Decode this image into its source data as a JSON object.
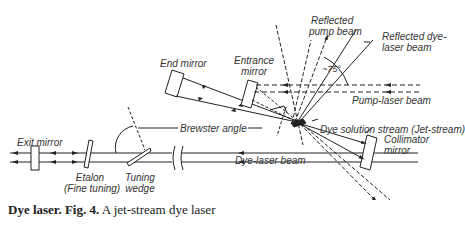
{
  "diagram": {
    "title": "A jet-stream dye laser",
    "labels": {
      "end_mirror": "End mirror",
      "entrance_mirror_1": "Entrance",
      "entrance_mirror_2": "mirror",
      "reflected_pump_1": "Reflected",
      "reflected_pump_2": "pump beam",
      "reflected_dye_1": "Reflected dye-",
      "reflected_dye_2": "laser beam",
      "angle": "~75°",
      "pump_laser_beam": "Pump-laser beam",
      "brewster_angle": "Brewster angle",
      "dye_solution": "Dye solution stream (Jet-stream)",
      "exit_mirror": "Exit mirror",
      "etalon_1": "Etalon",
      "etalon_2": "(Fine tuning)",
      "tuning_1": "Tuning",
      "tuning_2": "wedge",
      "dye_laser_beam": "Dye-laser beam",
      "collimator_1": "Collimator",
      "collimator_2": "mirror"
    },
    "components": [
      "Exit mirror",
      "Etalon",
      "Tuning wedge",
      "Collimator mirror",
      "Dye solution stream (Jet-stream)",
      "End mirror",
      "Entrance mirror"
    ]
  },
  "caption": {
    "bold": "Dye laser. Fig. 4.",
    "text": " A jet-stream dye laser"
  }
}
